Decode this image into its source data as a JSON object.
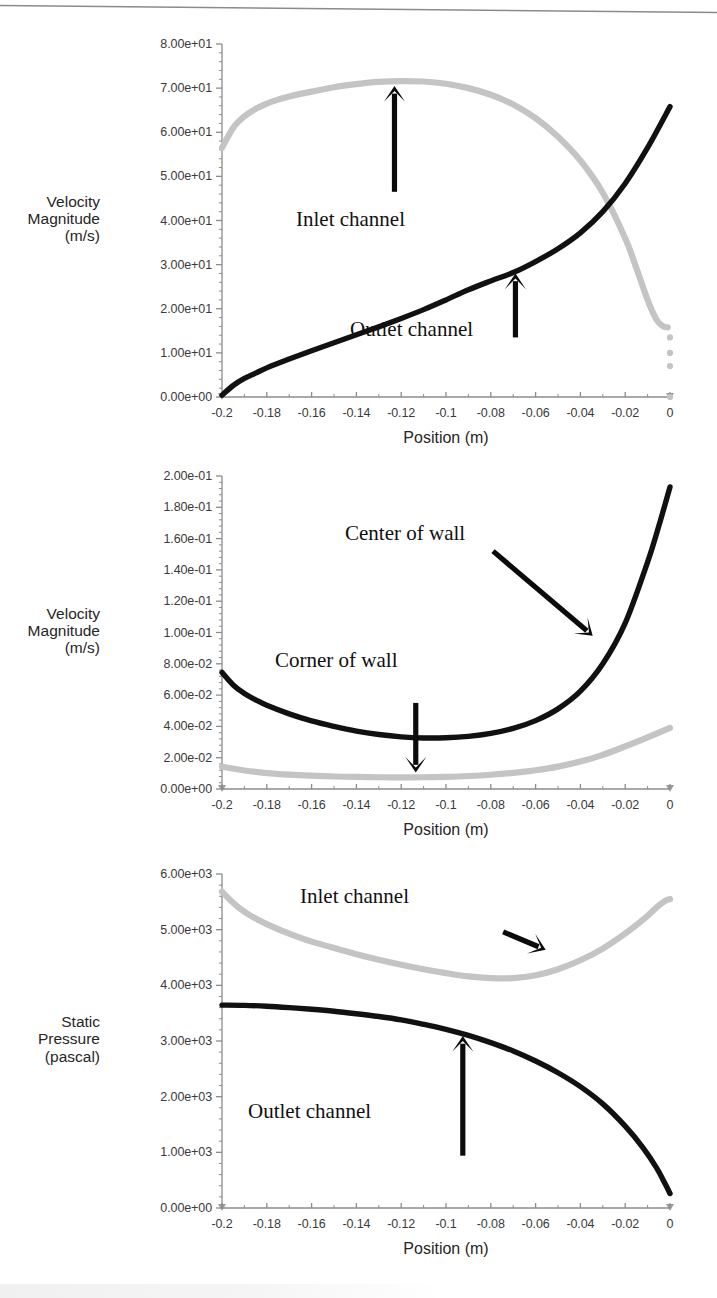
{
  "figure": {
    "axis_color": "#8c8c8c",
    "series_dark_color": "#111111",
    "series_light_color": "#c4c4c4",
    "x_title": "Position (m)",
    "x_ticks": [
      "-0.2",
      "-0.18",
      "-0.16",
      "-0.14",
      "-0.12",
      "-0.1",
      "-0.08",
      "-0.06",
      "-0.04",
      "-0.02",
      "0"
    ]
  },
  "chart_data": [
    {
      "type": "line",
      "id": "panel-1-velocity",
      "title": "",
      "xlabel": "Position (m)",
      "ylabel": "Velocity\nMagnitude\n(m/s)",
      "ylabel_lines": [
        "Velocity",
        "Magnitude",
        "(m/s)"
      ],
      "xlim": [
        -0.2,
        0
      ],
      "ylim": [
        0,
        80
      ],
      "grid": false,
      "legend": "annotations",
      "xtick_labels": [
        "-0.2",
        "-0.18",
        "-0.16",
        "-0.14",
        "-0.12",
        "-0.1",
        "-0.08",
        "-0.06",
        "-0.04",
        "-0.02",
        "0"
      ],
      "xtick_values": [
        -0.2,
        -0.18,
        -0.16,
        -0.14,
        -0.12,
        -0.1,
        -0.08,
        -0.06,
        -0.04,
        -0.02,
        0
      ],
      "ytick_labels": [
        "0.00e+00",
        "1.00e+01",
        "2.00e+01",
        "3.00e+01",
        "4.00e+01",
        "5.00e+01",
        "6.00e+01",
        "7.00e+01",
        "8.00e+01"
      ],
      "ytick_values": [
        0,
        10,
        20,
        30,
        40,
        50,
        60,
        70,
        80
      ],
      "annotations": [
        {
          "text": "Inlet channel",
          "target_x": -0.123,
          "target_y": 70.5,
          "tail_x": -0.123,
          "tail_y": 46.5,
          "arrow": "up"
        },
        {
          "text": "Outlet channel",
          "target_x": -0.069,
          "target_y": 28.0,
          "tail_x": -0.069,
          "tail_y": 13.5,
          "arrow": "up"
        }
      ],
      "series": [
        {
          "name": "Inlet channel",
          "color": "#c4c4c4",
          "x": [
            -0.2,
            -0.195,
            -0.19,
            -0.185,
            -0.18,
            -0.175,
            -0.17,
            -0.165,
            -0.16,
            -0.15,
            -0.14,
            -0.13,
            -0.12,
            -0.11,
            -0.1,
            -0.09,
            -0.08,
            -0.07,
            -0.06,
            -0.05,
            -0.04,
            -0.03,
            -0.02,
            -0.015,
            -0.01,
            -0.006,
            -0.003,
            -0.001
          ],
          "values": [
            56.5,
            61.0,
            63.6,
            65.3,
            66.5,
            67.4,
            68.1,
            68.7,
            69.2,
            70.2,
            70.9,
            71.4,
            71.6,
            71.5,
            71.0,
            70.0,
            68.5,
            66.3,
            63.2,
            59.0,
            53.6,
            46.3,
            36.0,
            29.2,
            22.0,
            17.5,
            16.0,
            15.8
          ]
        },
        {
          "name": "Inlet channel tail points",
          "color": "#c4c4c4",
          "marker": "dot",
          "x": [
            0,
            0,
            0,
            0
          ],
          "values": [
            13.5,
            10.0,
            7.0,
            0.0
          ]
        },
        {
          "name": "Outlet channel",
          "color": "#111111",
          "x": [
            -0.2,
            -0.195,
            -0.19,
            -0.185,
            -0.18,
            -0.17,
            -0.16,
            -0.15,
            -0.14,
            -0.13,
            -0.12,
            -0.11,
            -0.1,
            -0.09,
            -0.08,
            -0.07,
            -0.06,
            -0.05,
            -0.04,
            -0.03,
            -0.02,
            -0.01,
            0.0
          ],
          "values": [
            0.4,
            2.6,
            4.2,
            5.4,
            6.6,
            8.6,
            10.5,
            12.3,
            14.1,
            15.9,
            17.8,
            19.8,
            22.0,
            24.3,
            26.3,
            28.2,
            30.7,
            33.6,
            37.2,
            42.0,
            48.4,
            56.5,
            65.8
          ]
        }
      ]
    },
    {
      "type": "line",
      "id": "panel-2-velocity-wall",
      "title": "",
      "xlabel": "Position (m)",
      "ylabel": "Velocity\nMagnitude\n(m/s)",
      "ylabel_lines": [
        "Velocity",
        "Magnitude",
        "(m/s)"
      ],
      "xlim": [
        -0.2,
        0
      ],
      "ylim": [
        0,
        0.2
      ],
      "grid": false,
      "legend": "annotations",
      "xtick_labels": [
        "-0.2",
        "-0.18",
        "-0.16",
        "-0.14",
        "-0.12",
        "-0.1",
        "-0.08",
        "-0.06",
        "-0.04",
        "-0.02",
        "0"
      ],
      "xtick_values": [
        -0.2,
        -0.18,
        -0.16,
        -0.14,
        -0.12,
        -0.1,
        -0.08,
        -0.06,
        -0.04,
        -0.02,
        0
      ],
      "ytick_labels": [
        "0.00e+00",
        "2.00e-02",
        "4.00e-02",
        "6.00e-02",
        "8.00e-02",
        "1.00e-01",
        "1.20e-01",
        "1.40e-01",
        "1.60e-01",
        "1.80e-01",
        "2.00e-01"
      ],
      "ytick_values": [
        0,
        0.02,
        0.04,
        0.06,
        0.08,
        0.1,
        0.12,
        0.14,
        0.16,
        0.18,
        0.2
      ],
      "annotations": [
        {
          "text": "Center of wall",
          "target_x": -0.0345,
          "target_y": 0.098,
          "tail_x": -0.079,
          "tail_y": 0.152,
          "arrow": "diagonal-down-right"
        },
        {
          "text": "Corner of wall",
          "target_x": -0.1135,
          "target_y": 0.0105,
          "tail_x": -0.1135,
          "tail_y": 0.055,
          "arrow": "down"
        }
      ],
      "series": [
        {
          "name": "Center of wall",
          "color": "#111111",
          "x": [
            -0.2,
            -0.195,
            -0.19,
            -0.185,
            -0.18,
            -0.17,
            -0.16,
            -0.15,
            -0.14,
            -0.13,
            -0.12,
            -0.11,
            -0.1,
            -0.09,
            -0.08,
            -0.07,
            -0.06,
            -0.05,
            -0.04,
            -0.03,
            -0.02,
            -0.01,
            -0.005,
            0.0
          ],
          "values": [
            0.0745,
            0.0665,
            0.061,
            0.057,
            0.0535,
            0.048,
            0.0435,
            0.04,
            0.037,
            0.0348,
            0.0333,
            0.0326,
            0.0327,
            0.0336,
            0.0355,
            0.0387,
            0.0437,
            0.0512,
            0.0625,
            0.08,
            0.106,
            0.145,
            0.168,
            0.193
          ]
        },
        {
          "name": "Corner of wall",
          "color": "#c4c4c4",
          "x": [
            -0.2,
            -0.19,
            -0.18,
            -0.17,
            -0.16,
            -0.15,
            -0.14,
            -0.13,
            -0.12,
            -0.11,
            -0.1,
            -0.09,
            -0.08,
            -0.07,
            -0.06,
            -0.05,
            -0.04,
            -0.03,
            -0.02,
            -0.01,
            0.0
          ],
          "values": [
            0.0142,
            0.0118,
            0.0102,
            0.0092,
            0.0085,
            0.008,
            0.0077,
            0.0075,
            0.0074,
            0.0075,
            0.0078,
            0.0083,
            0.0091,
            0.0103,
            0.012,
            0.0143,
            0.0175,
            0.0218,
            0.0272,
            0.033,
            0.039
          ]
        }
      ]
    },
    {
      "type": "line",
      "id": "panel-3-static-pressure",
      "title": "",
      "xlabel": "Position (m)",
      "ylabel": "Static\nPressure\n(pascal)",
      "ylabel_lines": [
        "Static",
        "Pressure",
        "(pascal)"
      ],
      "xlim": [
        -0.2,
        0
      ],
      "ylim": [
        0,
        6000
      ],
      "grid": false,
      "legend": "annotations",
      "xtick_labels": [
        "-0.2",
        "-0.18",
        "-0.16",
        "-0.14",
        "-0.12",
        "-0.1",
        "-0.08",
        "-0.06",
        "-0.04",
        "-0.02",
        "0"
      ],
      "xtick_values": [
        -0.2,
        -0.18,
        -0.16,
        -0.14,
        -0.12,
        -0.1,
        -0.08,
        -0.06,
        -0.04,
        -0.02,
        0
      ],
      "ytick_labels": [
        "0.00e+00",
        "1.00e+03",
        "2.00e+03",
        "3.00e+03",
        "4.00e+03",
        "5.00e+03",
        "6.00e+03"
      ],
      "ytick_values": [
        0,
        1000,
        2000,
        3000,
        4000,
        5000,
        6000
      ],
      "annotations": [
        {
          "text": "Inlet channel",
          "target_x": -0.0555,
          "target_y": 4640,
          "tail_x": -0.0745,
          "tail_y": 4960,
          "arrow": "diagonal-down-right"
        },
        {
          "text": "Outlet channel",
          "target_x": -0.0925,
          "target_y": 3090,
          "tail_x": -0.0925,
          "tail_y": 940,
          "arrow": "up"
        }
      ],
      "series": [
        {
          "name": "Inlet channel",
          "color": "#c4c4c4",
          "x": [
            -0.2,
            -0.196,
            -0.192,
            -0.188,
            -0.184,
            -0.18,
            -0.172,
            -0.164,
            -0.156,
            -0.148,
            -0.14,
            -0.13,
            -0.12,
            -0.11,
            -0.1,
            -0.09,
            -0.08,
            -0.07,
            -0.06,
            -0.05,
            -0.04,
            -0.03,
            -0.02,
            -0.012,
            -0.006,
            -0.002,
            0.0
          ],
          "values": [
            5680,
            5520,
            5380,
            5270,
            5180,
            5100,
            4960,
            4840,
            4740,
            4650,
            4560,
            4460,
            4370,
            4290,
            4220,
            4160,
            4130,
            4130,
            4180,
            4290,
            4450,
            4660,
            4930,
            5180,
            5400,
            5520,
            5550
          ]
        },
        {
          "name": "Outlet channel",
          "color": "#111111",
          "x": [
            -0.2,
            -0.19,
            -0.18,
            -0.17,
            -0.16,
            -0.15,
            -0.14,
            -0.13,
            -0.12,
            -0.11,
            -0.1,
            -0.09,
            -0.08,
            -0.07,
            -0.06,
            -0.05,
            -0.04,
            -0.03,
            -0.02,
            -0.012,
            -0.006,
            -0.002,
            0.0
          ],
          "values": [
            3645,
            3640,
            3625,
            3600,
            3570,
            3535,
            3490,
            3440,
            3380,
            3300,
            3210,
            3100,
            2970,
            2820,
            2640,
            2430,
            2180,
            1870,
            1470,
            1080,
            720,
            420,
            260
          ]
        }
      ]
    }
  ]
}
